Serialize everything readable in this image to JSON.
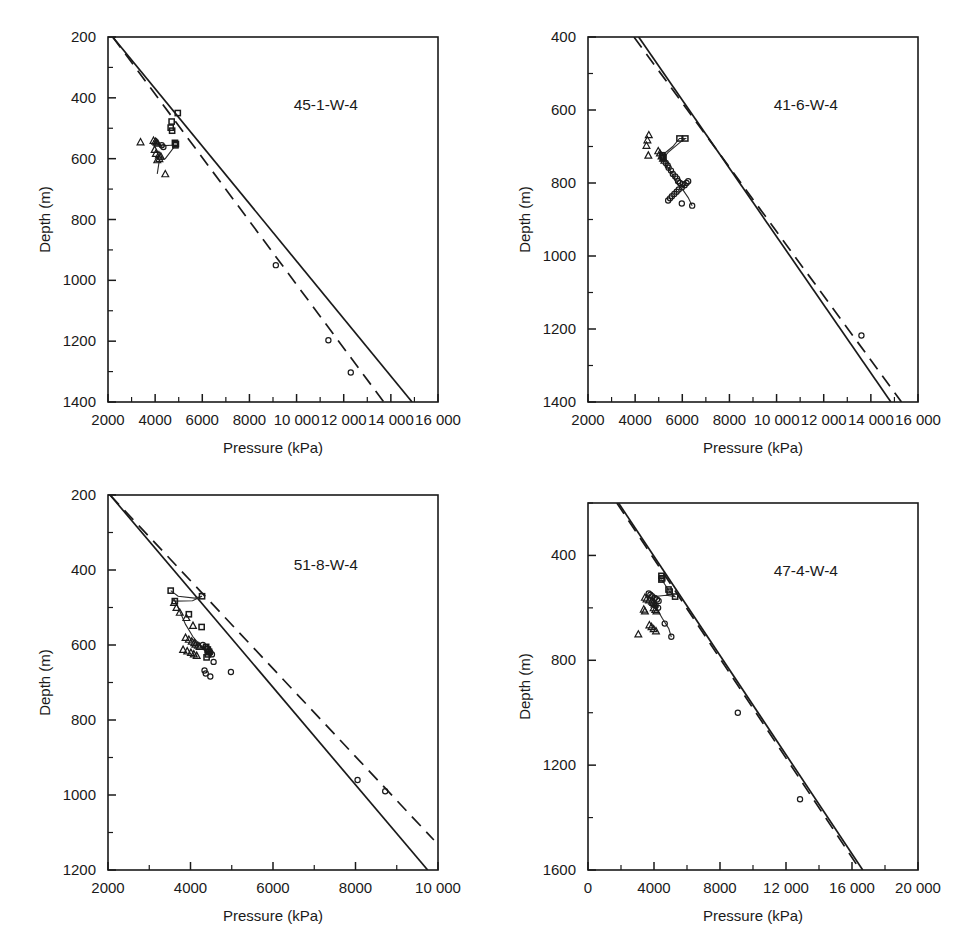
{
  "figure": {
    "caption_remnant": "",
    "background": "#ffffff",
    "ink": "#1a1a1a"
  },
  "common": {
    "xlabel": "Pressure (kPa)",
    "ylabel": "Depth (m)",
    "series_names": [
      "square-series",
      "triangle-series",
      "circle-series"
    ],
    "reference_lines": [
      "solid-reference-line",
      "dashed-reference-line"
    ]
  },
  "chart_data": [
    {
      "id": "panel-45-1-W-4",
      "type": "scatter",
      "title": "45-1-W-4",
      "xlabel": "Pressure (kPa)",
      "ylabel": "Depth (m)",
      "xlim": [
        2000,
        16000
      ],
      "ylim": [
        200,
        1400
      ],
      "y_inverted": true,
      "grid": false,
      "xticks": [
        2000,
        4000,
        6000,
        8000,
        10000,
        12000,
        14000,
        16000
      ],
      "xticklabels": [
        "2000",
        "4000",
        "6000",
        "8000",
        "10 000",
        "12 000",
        "14 000",
        "16 000"
      ],
      "xminor_step": 1000,
      "yticks": [
        200,
        400,
        600,
        800,
        1000,
        1200,
        1400
      ],
      "yticklabels": [
        "200",
        "400",
        "600",
        "800",
        "1000",
        "1200",
        "1400"
      ],
      "yminor_step": 100,
      "lines": [
        {
          "name": "solid-reference-line",
          "style": "solid",
          "x": [
            2200,
            14900
          ],
          "y": [
            200,
            1400
          ]
        },
        {
          "name": "dashed-reference-line",
          "style": "dashed",
          "x": [
            2200,
            13700
          ],
          "y": [
            200,
            1400
          ]
        }
      ],
      "series": [
        {
          "name": "square-series",
          "marker": "square",
          "x": [
            4960,
            4700,
            4660,
            4720,
            4840,
            4880,
            4860
          ],
          "y": [
            450,
            478,
            498,
            508,
            548,
            552,
            556
          ]
        },
        {
          "name": "triangle-series",
          "marker": "triangle",
          "x": [
            3380,
            3930,
            4010,
            4060,
            4110,
            3980,
            4030,
            4160,
            4240,
            4180,
            4090,
            4430
          ],
          "y": [
            545,
            540,
            543,
            546,
            549,
            570,
            583,
            588,
            592,
            600,
            604,
            650
          ]
        },
        {
          "name": "circle-series",
          "marker": "circle",
          "x": [
            4280,
            4350,
            9120,
            11350,
            12300
          ],
          "y": [
            556,
            562,
            950,
            1197,
            1303
          ]
        }
      ],
      "connector": {
        "name": "connector-polyline",
        "x": [
          3930,
          4090,
          4240,
          4300,
          4420,
          4700,
          4860,
          4430,
          4180,
          4090
        ],
        "y": [
          540,
          552,
          556,
          558,
          557,
          556,
          556,
          600,
          604,
          650
        ]
      }
    },
    {
      "id": "panel-41-6-W-4",
      "type": "scatter",
      "title": "41-6-W-4",
      "xlabel": "Pressure (kPa)",
      "ylabel": "Depth (m)",
      "xlim": [
        2000,
        16000
      ],
      "ylim": [
        400,
        1400
      ],
      "y_inverted": true,
      "grid": false,
      "xticks": [
        2000,
        4000,
        6000,
        8000,
        10000,
        12000,
        14000,
        16000
      ],
      "xticklabels": [
        "2000",
        "4000",
        "6000",
        "8000",
        "10 000",
        "12 000",
        "14 000",
        "16 000"
      ],
      "xminor_step": 1000,
      "yticks": [
        400,
        600,
        800,
        1000,
        1200,
        1400
      ],
      "yticklabels": [
        "400",
        "600",
        "800",
        "1000",
        "1200",
        "1400"
      ],
      "yminor_step": 100,
      "lines": [
        {
          "name": "solid-reference-line",
          "style": "solid",
          "x": [
            4150,
            14850
          ],
          "y": [
            400,
            1400
          ]
        },
        {
          "name": "dashed-reference-line",
          "style": "dashed",
          "x": [
            3950,
            15300
          ],
          "y": [
            400,
            1400
          ]
        }
      ],
      "series": [
        {
          "name": "square-series",
          "marker": "square",
          "x": [
            5880,
            6130,
            5150,
            5180,
            5200
          ],
          "y": [
            678,
            678,
            724,
            728,
            732
          ]
        },
        {
          "name": "triangle-series",
          "marker": "triangle",
          "x": [
            4580,
            4520,
            4480,
            4560,
            4980,
            5050,
            5120,
            5180,
            5240
          ],
          "y": [
            668,
            682,
            697,
            724,
            712,
            718,
            726,
            732,
            738
          ]
        },
        {
          "name": "circle-series",
          "marker": "circle",
          "x": [
            5300,
            5380,
            5420,
            5520,
            5600,
            5700,
            5780,
            5820,
            5900,
            6020,
            6100,
            6180,
            6250,
            5980,
            5850,
            5760,
            5660,
            5560,
            5480,
            5400,
            5980,
            6420,
            13600
          ],
          "y": [
            745,
            752,
            758,
            766,
            775,
            782,
            788,
            795,
            800,
            803,
            806,
            800,
            795,
            812,
            818,
            824,
            830,
            836,
            842,
            848,
            856,
            862,
            1218
          ]
        }
      ],
      "connector": {
        "name": "connector-polyline",
        "x": [
          5150,
          5600,
          5880,
          6130,
          5880,
          5400,
          5200,
          5300,
          5560,
          5760,
          6020,
          6250,
          6420
        ],
        "y": [
          724,
          700,
          678,
          678,
          690,
          716,
          732,
          748,
          775,
          800,
          818,
          840,
          862
        ]
      }
    },
    {
      "id": "panel-51-8-W-4",
      "type": "scatter",
      "title": "51-8-W-4",
      "xlabel": "Pressure (kPa)",
      "ylabel": "Depth (m)",
      "xlim": [
        2000,
        10000
      ],
      "ylim": [
        200,
        1200
      ],
      "y_inverted": true,
      "grid": false,
      "xticks": [
        2000,
        4000,
        6000,
        8000,
        10000
      ],
      "xticklabels": [
        "2000",
        "4000",
        "6000",
        "8000",
        "10 000"
      ],
      "xminor_step": 1000,
      "yticks": [
        200,
        400,
        600,
        800,
        1000,
        1200
      ],
      "yticklabels": [
        "200",
        "400",
        "600",
        "800",
        "1000",
        "1200"
      ],
      "yminor_step": 100,
      "lines": [
        {
          "name": "solid-reference-line",
          "style": "solid",
          "x": [
            2050,
            9750
          ],
          "y": [
            200,
            1200
          ]
        },
        {
          "name": "dashed-reference-line",
          "style": "dashed",
          "x": [
            2050,
            9900
          ],
          "y": [
            200,
            1120
          ]
        }
      ],
      "series": [
        {
          "name": "square-series",
          "marker": "square",
          "x": [
            3520,
            3620,
            4280,
            3960,
            4270,
            4380,
            4420,
            4450,
            4420,
            4390
          ],
          "y": [
            455,
            483,
            470,
            518,
            552,
            605,
            612,
            618,
            625,
            633
          ]
        },
        {
          "name": "triangle-series",
          "marker": "triangle",
          "x": [
            3600,
            3660,
            3740,
            3900,
            4060,
            3880,
            3960,
            4030,
            4090,
            4120,
            4180,
            4220,
            3820,
            3920,
            4010,
            4080,
            4150
          ],
          "y": [
            487,
            500,
            513,
            527,
            548,
            580,
            585,
            590,
            594,
            598,
            601,
            604,
            612,
            616,
            620,
            624,
            628
          ]
        },
        {
          "name": "circle-series",
          "marker": "circle",
          "x": [
            4300,
            4360,
            4400,
            4450,
            4480,
            4520,
            4560,
            4340,
            4370,
            4480,
            4980,
            8050,
            8720
          ],
          "y": [
            600,
            606,
            610,
            616,
            620,
            625,
            645,
            668,
            676,
            684,
            672,
            960,
            990
          ]
        }
      ],
      "connector": {
        "name": "connector-polyline",
        "x": [
          3520,
          3700,
          4100,
          4280,
          4050,
          3620,
          3700,
          3880,
          4060,
          4230,
          4400,
          4520
        ],
        "y": [
          455,
          470,
          475,
          470,
          482,
          483,
          500,
          545,
          578,
          600,
          615,
          630
        ]
      }
    },
    {
      "id": "panel-47-4-W-4",
      "type": "scatter",
      "title": "47-4-W-4",
      "xlabel": "Pressure (kPa)",
      "ylabel": "Depth (m)",
      "xlim": [
        0,
        20000
      ],
      "ylim": [
        200,
        1600
      ],
      "y_inverted": true,
      "grid": false,
      "xticks": [
        0,
        4000,
        8000,
        12000,
        16000,
        20000
      ],
      "xticklabels": [
        "0",
        "4000",
        "8000",
        "12 000",
        "16 000",
        "20 000"
      ],
      "xminor_step": 2000,
      "yticks": [
        400,
        800,
        1200,
        1600
      ],
      "yticklabels": [
        "400",
        "800",
        "1200",
        "1600"
      ],
      "yminor_step": 200,
      "lines": [
        {
          "name": "solid-reference-line",
          "style": "solid",
          "x": [
            1850,
            16650
          ],
          "y": [
            200,
            1600
          ]
        },
        {
          "name": "dashed-reference-line",
          "style": "dashed",
          "x": [
            1750,
            16500
          ],
          "y": [
            200,
            1600
          ]
        }
      ],
      "series": [
        {
          "name": "square-series",
          "marker": "square",
          "x": [
            4450,
            4500,
            4450,
            4880,
            4950,
            5280
          ],
          "y": [
            478,
            487,
            492,
            530,
            538,
            557
          ]
        },
        {
          "name": "triangle-series",
          "marker": "triangle",
          "x": [
            3450,
            3550,
            3700,
            3880,
            3950,
            4020,
            3380,
            3450,
            3980,
            4080,
            4150,
            3050,
            3720,
            3850,
            3980,
            4120
          ],
          "y": [
            560,
            566,
            570,
            575,
            580,
            585,
            605,
            612,
            600,
            606,
            612,
            700,
            665,
            672,
            680,
            688
          ]
        },
        {
          "name": "circle-series",
          "marker": "circle",
          "x": [
            3680,
            3780,
            3880,
            4050,
            4180,
            4280,
            4100,
            4250,
            4650,
            5050,
            9080,
            12850
          ],
          "y": [
            545,
            550,
            556,
            562,
            568,
            574,
            592,
            600,
            660,
            710,
            1000,
            1330
          ]
        }
      ],
      "connector": {
        "name": "connector-polyline",
        "x": [
          4450,
          4600,
          4950,
          5280,
          4750,
          4180,
          3880,
          4050,
          4250,
          4500,
          4900,
          5050
        ],
        "y": [
          492,
          505,
          538,
          557,
          552,
          556,
          560,
          590,
          612,
          640,
          680,
          712
        ]
      }
    }
  ]
}
